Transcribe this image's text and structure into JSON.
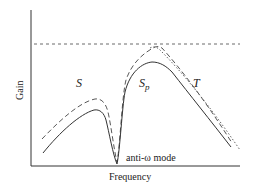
{
  "figure": {
    "xlabel": "Frequency",
    "ylabel": "Gain",
    "annotation": "anti-ω mode",
    "regions": {
      "s": "S",
      "sp_base": "S",
      "sp_sub": "p",
      "t": "T"
    },
    "curves": [
      {
        "name": "gain-curve-solid",
        "style": "solid"
      },
      {
        "name": "gain-curve-dashed",
        "style": "dashed"
      },
      {
        "name": "gain-curve-dotted",
        "style": "dotted"
      },
      {
        "name": "saturation-level-line",
        "style": "dashed-horizontal"
      }
    ],
    "colors": {
      "line": "#333333",
      "background": "#ffffff"
    }
  }
}
